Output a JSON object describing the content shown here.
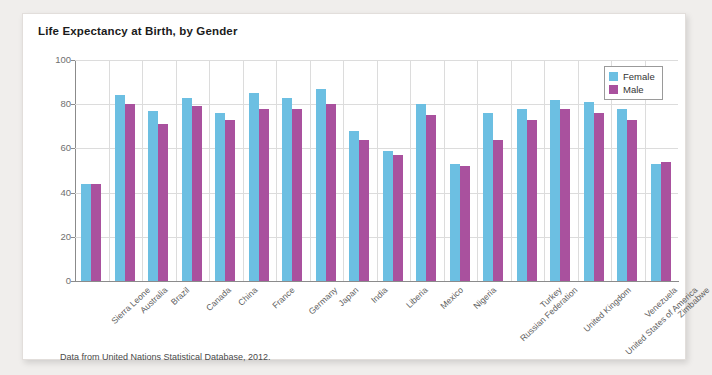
{
  "card": {
    "title": "Life Expectancy at Birth, by Gender",
    "footnote": "Data from United Nations Statistical Database, 2012."
  },
  "legend": {
    "position": "top-right",
    "entries": [
      {
        "label": "Female",
        "color": "#6cbfe2"
      },
      {
        "label": "Male",
        "color": "#a9519e"
      }
    ]
  },
  "chart_data": {
    "type": "bar",
    "title": "Life Expectancy at Birth, by Gender",
    "xlabel": "",
    "ylabel": "",
    "ylim": [
      0,
      100
    ],
    "yticks": [
      0,
      20,
      40,
      60,
      80,
      100
    ],
    "grid": true,
    "legend_position": "top-right",
    "categories": [
      "Sierra Leone",
      "Australia",
      "Brazil",
      "Canada",
      "China",
      "France",
      "Germany",
      "Japan",
      "India",
      "Liberia",
      "Mexico",
      "Nigeria",
      "Russian Federation",
      "Turkey",
      "United Kingdom",
      "United States of America",
      "Venezuela",
      "Zimbabwe"
    ],
    "series": [
      {
        "name": "Female",
        "color": "#6cbfe2",
        "values": [
          44,
          84,
          77,
          83,
          76,
          85,
          83,
          87,
          68,
          59,
          80,
          53,
          76,
          78,
          82,
          81,
          78,
          53
        ]
      },
      {
        "name": "Male",
        "color": "#a9519e",
        "values": [
          44,
          80,
          71,
          79,
          73,
          78,
          78,
          80,
          64,
          57,
          75,
          52,
          64,
          73,
          78,
          76,
          73,
          54
        ]
      }
    ]
  }
}
